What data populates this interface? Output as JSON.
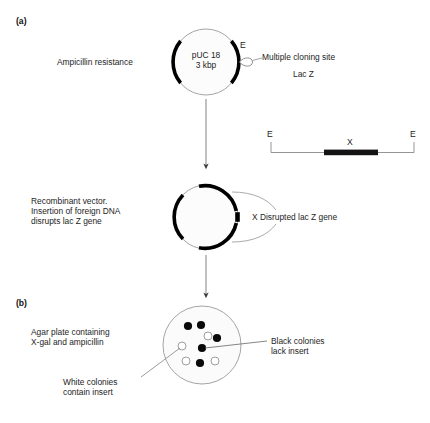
{
  "figure": {
    "panels": [
      {
        "id": "a",
        "tag": "(a)"
      },
      {
        "id": "b",
        "tag": "(b)"
      }
    ]
  },
  "panel_a": {
    "plasmid": {
      "name_line1": "pUC 18",
      "name_line2": "3 kbp",
      "ampicillin_label": "Ampicillin resistance",
      "mcs_label": "Multiple cloning site",
      "lacz_label": "Lac Z",
      "ecori_site_label": "E"
    },
    "insert_fragment": {
      "left_site_label": "E",
      "right_site_label": "E",
      "insert_label": "X"
    },
    "recombinant": {
      "caption_line1": "Recombinant vector.",
      "caption_line2": "Insertion of foreign DNA",
      "caption_line3": "disrupts lac Z gene",
      "disrupted_label": "X Disrupted lac Z gene"
    }
  },
  "panel_b": {
    "plate": {
      "caption_line1": "Agar plate containing",
      "caption_line2": "X-gal and ampicillin",
      "black_colonies_line1": "Black colonies",
      "black_colonies_line2": "lack insert",
      "white_colonies_line1": "White colonies",
      "white_colonies_line2": "contain insert"
    },
    "colonies": {
      "black": [
        {
          "x": 188,
          "y": 326
        },
        {
          "x": 201,
          "y": 325
        },
        {
          "x": 217,
          "y": 338
        },
        {
          "x": 202,
          "y": 348
        },
        {
          "x": 200,
          "y": 363
        }
      ],
      "white": [
        {
          "x": 208,
          "y": 336
        },
        {
          "x": 182,
          "y": 346
        },
        {
          "x": 186,
          "y": 361
        },
        {
          "x": 215,
          "y": 361
        }
      ]
    }
  },
  "colors": {
    "ink": "#1a1a1a",
    "feature_black": "#000000",
    "outline_gray": "#8c8c8c",
    "plate_fill": "#fbfbfb",
    "colony_white_fill": "#ffffff"
  }
}
